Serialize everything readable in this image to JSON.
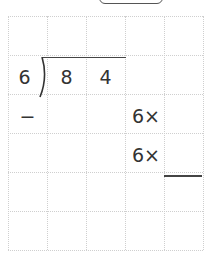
{
  "problem": {
    "divisor": "6",
    "dividend_digits": [
      "8",
      "4"
    ],
    "minus_sign": "−",
    "multiply_rows": [
      "6×",
      "6×"
    ]
  },
  "grid": {
    "columns": 5,
    "rows": 6
  },
  "colors": {
    "ink": "#333333",
    "grid": "#cfcfcf"
  }
}
